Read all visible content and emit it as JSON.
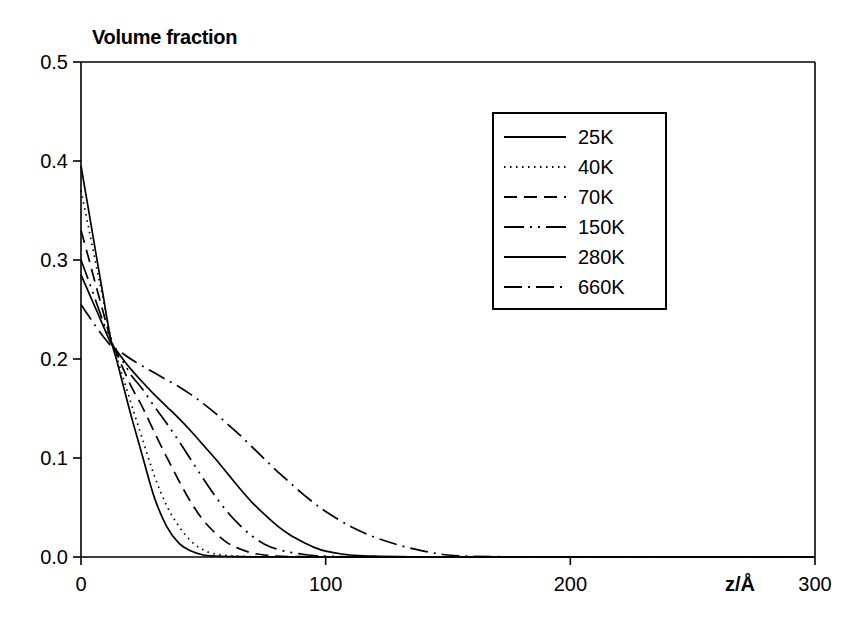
{
  "chart_data": {
    "type": "line",
    "title": "Volume fraction",
    "xlabel": "z/Å",
    "ylabel": "Volume fraction",
    "xlim": [
      0,
      300
    ],
    "ylim": [
      0,
      0.5
    ],
    "xticks": [
      "0",
      "100",
      "200",
      "300"
    ],
    "xtick_values": [
      0,
      100,
      200,
      300
    ],
    "yticks": [
      "0.0",
      "0.1",
      "0.2",
      "0.3",
      "0.4",
      "0.5"
    ],
    "ytick_values": [
      0.0,
      0.1,
      0.2,
      0.3,
      0.4,
      0.5
    ],
    "grid": false,
    "legend_position": "upper-center-right",
    "x": [
      0,
      3,
      6,
      9,
      12,
      15,
      18,
      21,
      25,
      30,
      35,
      40,
      45,
      50,
      55,
      60,
      65,
      70,
      75,
      80,
      85,
      90,
      95,
      100,
      110,
      120,
      130,
      140,
      150,
      160,
      180,
      200,
      220,
      250,
      280,
      300
    ],
    "series": [
      {
        "name": "25K",
        "dash": "solid",
        "values": [
          0.395,
          0.352,
          0.308,
          0.265,
          0.222,
          0.195,
          0.166,
          0.138,
          0.103,
          0.06,
          0.031,
          0.014,
          0.006,
          0.002,
          0.001,
          0.0005,
          0.0003,
          0.0002,
          0.0001,
          0.0001,
          0.0,
          0.0,
          0.0,
          0.0,
          0.0,
          0.0,
          0.0,
          0.0,
          0.0,
          0.0,
          0.0,
          0.0,
          0.0,
          0.0,
          0.0,
          0.0
        ]
      },
      {
        "name": "40K",
        "dash": "dotted",
        "values": [
          0.37,
          0.334,
          0.297,
          0.261,
          0.224,
          0.199,
          0.175,
          0.151,
          0.12,
          0.082,
          0.052,
          0.031,
          0.016,
          0.007,
          0.003,
          0.0015,
          0.0008,
          0.0004,
          0.0002,
          0.0001,
          0.0001,
          0.0,
          0.0,
          0.0,
          0.0,
          0.0,
          0.0,
          0.0,
          0.0,
          0.0,
          0.0,
          0.0,
          0.0,
          0.0,
          0.0,
          0.0
        ]
      },
      {
        "name": "70K",
        "dash": "dashed",
        "values": [
          0.33,
          0.303,
          0.275,
          0.248,
          0.221,
          0.203,
          0.186,
          0.17,
          0.152,
          0.126,
          0.101,
          0.077,
          0.055,
          0.037,
          0.024,
          0.014,
          0.008,
          0.004,
          0.002,
          0.001,
          0.0005,
          0.0003,
          0.0002,
          0.0001,
          0.0,
          0.0,
          0.0,
          0.0,
          0.0,
          0.0,
          0.0,
          0.0,
          0.0,
          0.0,
          0.0,
          0.0
        ]
      },
      {
        "name": "150K",
        "dash": "dash-dot-dot",
        "values": [
          0.3,
          0.28,
          0.259,
          0.238,
          0.218,
          0.206,
          0.194,
          0.182,
          0.17,
          0.152,
          0.135,
          0.117,
          0.098,
          0.079,
          0.061,
          0.045,
          0.032,
          0.021,
          0.013,
          0.008,
          0.005,
          0.003,
          0.0015,
          0.0008,
          0.0003,
          0.0001,
          0.0,
          0.0,
          0.0,
          0.0,
          0.0,
          0.0,
          0.0,
          0.0,
          0.0,
          0.0
        ]
      },
      {
        "name": "280K",
        "dash": "solid",
        "values": [
          0.285,
          0.268,
          0.251,
          0.234,
          0.217,
          0.207,
          0.197,
          0.188,
          0.177,
          0.164,
          0.152,
          0.14,
          0.127,
          0.113,
          0.099,
          0.084,
          0.069,
          0.055,
          0.043,
          0.032,
          0.023,
          0.016,
          0.01,
          0.006,
          0.002,
          0.0008,
          0.0003,
          0.0001,
          0.0,
          0.0,
          0.0,
          0.0,
          0.0,
          0.0,
          0.0,
          0.0
        ]
      },
      {
        "name": "660K",
        "dash": "dash-dot",
        "values": [
          0.255,
          0.244,
          0.233,
          0.223,
          0.214,
          0.209,
          0.204,
          0.199,
          0.193,
          0.186,
          0.179,
          0.172,
          0.164,
          0.155,
          0.145,
          0.134,
          0.123,
          0.111,
          0.099,
          0.087,
          0.076,
          0.065,
          0.055,
          0.046,
          0.031,
          0.02,
          0.012,
          0.006,
          0.002,
          0.0008,
          0.0001,
          0.0,
          0.0,
          0.0,
          0.0,
          0.0
        ]
      }
    ],
    "legend_entries": [
      {
        "label": "25K",
        "dash": "solid"
      },
      {
        "label": "40K",
        "dash": "dotted"
      },
      {
        "label": "70K",
        "dash": "dashed"
      },
      {
        "label": "150K",
        "dash": "dash-dot-dot"
      },
      {
        "label": "280K",
        "dash": "solid"
      },
      {
        "label": "660K",
        "dash": "dash-dot"
      }
    ]
  }
}
